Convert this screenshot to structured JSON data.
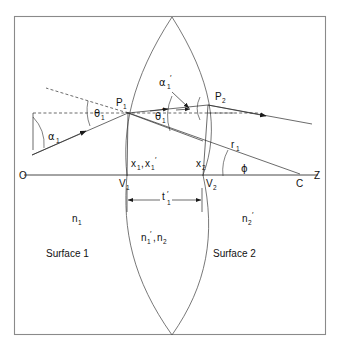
{
  "figure": {
    "type": "optical-ray-diagram",
    "background_color": "#ffffff",
    "line_color": "#1a1a1a",
    "frame_color": "#8a8a8a"
  },
  "axis": {
    "label_origin": "O",
    "label_vertex_1": "V",
    "label_vertex_1_sub": "1",
    "label_vertex_2": "V",
    "label_vertex_2_sub": "2",
    "label_center": "C",
    "label_axis": "Z"
  },
  "points": {
    "p1": "P",
    "p1_sub": "1",
    "p2": "P",
    "p2_sub": "2"
  },
  "angles": {
    "alpha_1": "α",
    "alpha_1_sub": "1",
    "alpha_1_prime": "α",
    "alpha_1_prime_sub": "1",
    "alpha_1_prime_mark": "′",
    "theta_1": "θ",
    "theta_1_sub": "1",
    "theta_1_prime": "θ",
    "theta_1_prime_sub": "1",
    "theta_1_prime_mark": "′",
    "phi": "ϕ"
  },
  "heights": {
    "x1_x1prime": "x",
    "x1_sub": "1",
    "x1_sep": ",",
    "x1_prime": "x",
    "x1_prime_sub": "1",
    "x1_prime_mark": "′",
    "x2": "x",
    "x2_sub": "2"
  },
  "radius": {
    "r1": "r",
    "r1_sub": "1"
  },
  "thickness": {
    "t1_prime": "t",
    "t1_prime_mark": "′",
    "t1_prime_sub": "1"
  },
  "indices": {
    "n1": "n",
    "n1_sub": "1",
    "n1_prime_n2": "n",
    "n1_prime_sub": "1",
    "n1_prime_mark": "′",
    "n1_prime_sep": ",",
    "n2": "n",
    "n2_sub": "2",
    "n2_prime": "n",
    "n2_prime_sub": "2",
    "n2_prime_mark": "′"
  },
  "surfaces": {
    "surface_1": "Surface 1",
    "surface_2": "Surface 2"
  }
}
